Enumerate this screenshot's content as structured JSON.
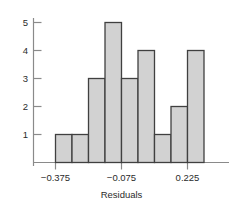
{
  "chart_data": {
    "type": "bar",
    "title": "",
    "subtitle": "",
    "xlabel": "Residuals",
    "ylabel": "",
    "grid": false,
    "legend": null,
    "bin_width": 0.05,
    "bin_start": -0.4,
    "categories": [
      "-0.400 to -0.350",
      "-0.350 to -0.300",
      "-0.300 to -0.250",
      "-0.250 to -0.200",
      "-0.200 to -0.150",
      "-0.150 to -0.100",
      "-0.100 to -0.050",
      "-0.050 to 0.000",
      "0.000 to 0.050"
    ],
    "bin_edges": [
      -0.4,
      -0.35,
      -0.3,
      -0.25,
      -0.2,
      -0.15,
      -0.1,
      -0.05,
      0.0,
      0.05
    ],
    "values": [
      1,
      1,
      3,
      5,
      3,
      4,
      1,
      2,
      4
    ],
    "total_count": 24,
    "xlim": [
      -0.45,
      0.1
    ],
    "ylim": [
      0,
      5
    ],
    "xticks": [
      -0.375,
      -0.075,
      0.225
    ],
    "xtick_labels": [
      "−0.375",
      "−0.075",
      "0.225"
    ],
    "yticks": [
      1,
      2,
      3,
      4,
      5
    ],
    "ytick_labels": [
      "1",
      "2",
      "3",
      "4",
      "5"
    ],
    "bar_fill_color": "#d2d2d2",
    "bar_edge_color": "#404040",
    "axis_color": "#8a8a8a",
    "text_color": "#2b2b2b"
  },
  "axes": {
    "x_title": "Residuals",
    "y_title": ""
  }
}
